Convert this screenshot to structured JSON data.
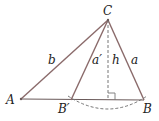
{
  "diagram": {
    "type": "triangle-ambiguous-case",
    "points": {
      "A": {
        "label": "A",
        "x": 21,
        "y": 99
      },
      "B_prime": {
        "label": "B′",
        "x": 71,
        "y": 100
      },
      "B": {
        "label": "B",
        "x": 144,
        "y": 100
      },
      "C": {
        "label": "C",
        "x": 108,
        "y": 20
      },
      "foot": {
        "x": 108,
        "y": 100
      }
    },
    "sides": {
      "b": "b",
      "a_prime": "a′",
      "h": "h",
      "a": "a"
    },
    "colors": {
      "side": "#8a6a6a",
      "base": "#6a5a5a",
      "dashed": "#777777",
      "text": "#222222"
    }
  }
}
